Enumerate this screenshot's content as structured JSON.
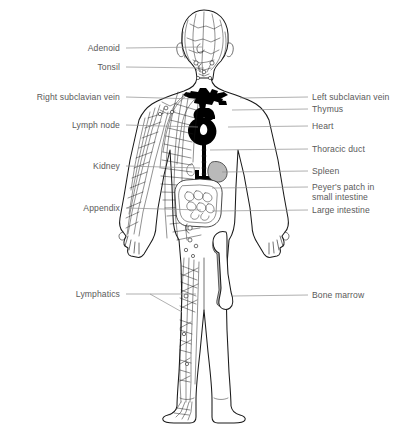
{
  "diagram": {
    "background_color": "#ffffff",
    "line_color": "#1a1a1a",
    "leader_color": "#8e8e8e",
    "text_color": "#5a5a5a",
    "organ_black_color": "#000000",
    "organ_gray_color": "#b9b9b9"
  },
  "labels_left": [
    {
      "id": "adenoid",
      "text": "Adenoid",
      "x": 120,
      "y": 52,
      "leader_to_x": 202,
      "leader_to_y": 47
    },
    {
      "id": "tonsil",
      "text": "Tonsil",
      "x": 120,
      "y": 70,
      "leader_to_x": 204,
      "leader_to_y": 68
    },
    {
      "id": "right-subclavian-vein",
      "text": "Right subclavian vein",
      "x": 120,
      "y": 100,
      "leader_to_x": 196,
      "leader_to_y": 99
    },
    {
      "id": "lymph-node",
      "text": "Lymph node",
      "x": 120,
      "y": 128,
      "leader_to_x": 198,
      "leader_to_y": 127
    },
    {
      "id": "kidney",
      "text": "Kidney",
      "x": 120,
      "y": 169,
      "leader_to_x": 200,
      "leader_to_y": 168
    },
    {
      "id": "appendix",
      "text": "Appendix",
      "x": 120,
      "y": 211,
      "leader_to_x": 201,
      "leader_to_y": 210
    },
    {
      "id": "lymphatics",
      "text": "Lymphatics",
      "x": 120,
      "y": 297,
      "leader_to_x": 196,
      "leader_to_y": 296
    }
  ],
  "labels_right": [
    {
      "id": "left-subclavian-vein",
      "text": "Left subclavian vein",
      "x": 312,
      "y": 100,
      "leader_from_x": 240,
      "leader_from_y": 98
    },
    {
      "id": "thymus",
      "text": "Thymus",
      "x": 312,
      "y": 111,
      "leader_from_x": 232,
      "leader_from_y": 110
    },
    {
      "id": "heart",
      "text": "Heart",
      "x": 312,
      "y": 128,
      "leader_from_x": 228,
      "leader_from_y": 127
    },
    {
      "id": "thoracic-duct",
      "text": "Thoracic duct",
      "x": 312,
      "y": 151,
      "leader_from_x": 218,
      "leader_from_y": 150
    },
    {
      "id": "spleen",
      "text": "Spleen",
      "x": 312,
      "y": 173,
      "leader_from_x": 226,
      "leader_from_y": 172
    },
    {
      "id": "large-intestine",
      "text": "Large intestine",
      "x": 312,
      "y": 212,
      "leader_from_x": 216,
      "leader_from_y": 211
    },
    {
      "id": "bone-marrow",
      "text": "Bone marrow",
      "x": 312,
      "y": 297,
      "leader_from_x": 233,
      "leader_from_y": 296
    }
  ],
  "labels_right_multiline": [
    {
      "id": "peyers-patch",
      "line1": "Peyer's patch in",
      "line2": "small intestine",
      "x": 312,
      "y1": 189,
      "y2": 199,
      "leader_from_x": 224,
      "leader_from_y": 188
    }
  ]
}
